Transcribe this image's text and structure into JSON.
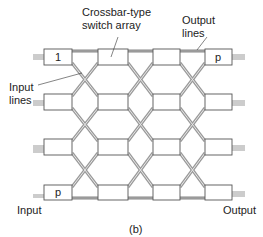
{
  "figure": {
    "caption": "(b)",
    "labels": {
      "crossbar_line1": "Crossbar-type",
      "crossbar_line2": "switch array",
      "output_lines_line1": "Output",
      "output_lines_line2": "lines",
      "input_lines_line1": "Input",
      "input_lines_line2": "lines",
      "input": "Input",
      "output": "Output"
    },
    "box_labels": {
      "first_input": "1",
      "last_input": "p",
      "first_output": "p"
    },
    "grid": {
      "rows": 4,
      "columns": 4
    }
  }
}
